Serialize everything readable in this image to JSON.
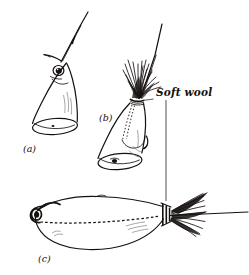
{
  "figure": {
    "background_color": "#ffffff",
    "ink_color": "#15110f",
    "width": 249,
    "height": 275,
    "medium": "pen-and-ink line drawing"
  },
  "labels": {
    "panel_a": "(a)",
    "panel_b": "(b)",
    "panel_c": "(c)"
  },
  "annotations": {
    "soft_wool": "Soft wool"
  },
  "panels": [
    {
      "id": "a",
      "label": "(a)",
      "caption_position": "below-left",
      "parts": [
        "fish-head-segment",
        "fish-eye",
        "gill-line",
        "cut-end-oval",
        "hook-shank",
        "hook-barb",
        "hook-point"
      ]
    },
    {
      "id": "b",
      "label": "(b)",
      "caption_position": "left",
      "parts": [
        "fish-head-segment",
        "fish-eye",
        "cut-end-oval",
        "soft-wool-tuft",
        "binding-thread",
        "stitch-dotted-line",
        "hook-shank",
        "hook-bend"
      ]
    },
    {
      "id": "c",
      "label": "(c)",
      "caption_position": "below-left",
      "parts": [
        "assembled-bait-body",
        "hook-eye-loop",
        "hook-point",
        "internal-dashed-line",
        "tail-binding",
        "soft-wool-tail",
        "trailing-line"
      ]
    }
  ]
}
